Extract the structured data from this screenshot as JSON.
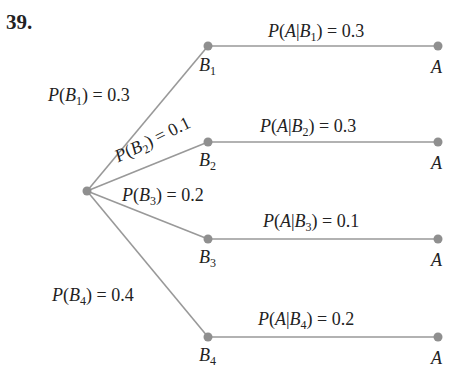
{
  "problem_number": "39.",
  "colors": {
    "line": "#999999",
    "node": "#8f8f8f",
    "text": "#222222"
  },
  "root": {
    "x": 87,
    "y": 191
  },
  "branches": [
    {
      "node": "B",
      "sub": "1",
      "x": 208,
      "y": 46,
      "prob_text": "= 0.3",
      "cond_text": "= 0.3",
      "leaf": "A",
      "prob_label": "P(B1) = 0.3",
      "cond_label": "P(A|B1) = 0.3"
    },
    {
      "node": "B",
      "sub": "2",
      "x": 208,
      "y": 142,
      "prob_text": "= 0.1",
      "cond_text": "= 0.3",
      "leaf": "A",
      "prob_label": "P(B2) = 0.1",
      "cond_label": "P(A|B2) = 0.3"
    },
    {
      "node": "B",
      "sub": "3",
      "x": 208,
      "y": 239,
      "prob_text": "= 0.2",
      "cond_text": "= 0.1",
      "leaf": "A",
      "prob_label": "P(B3) = 0.2",
      "cond_label": "P(A|B3) = 0.1"
    },
    {
      "node": "B",
      "sub": "4",
      "x": 208,
      "y": 337,
      "prob_text": "= 0.4",
      "cond_text": "= 0.2",
      "leaf": "A",
      "prob_label": "P(B4) = 0.4",
      "cond_label": "P(A|B4) = 0.2"
    }
  ],
  "leaf_x": 438,
  "text": {
    "P": "P",
    "B": "B",
    "A": "A",
    "open": "(",
    "close": ")",
    "bar": "|",
    "b1": "1",
    "b2": "2",
    "b3": "3",
    "b4": "4",
    "p1": "= 0.3",
    "p2": "= 0.1",
    "p3": "= 0.2",
    "p4": "= 0.4",
    "c1": "= 0.3",
    "c2": "= 0.3",
    "c3": "= 0.1",
    "c4": "= 0.2"
  }
}
